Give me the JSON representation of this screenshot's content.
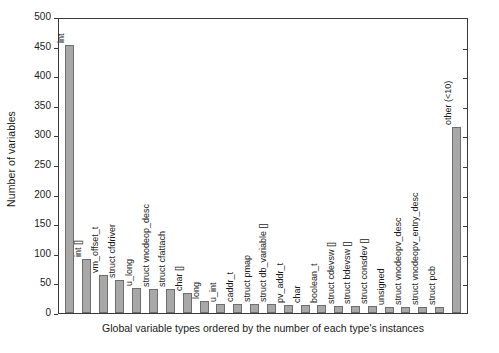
{
  "chart_data": {
    "type": "bar",
    "title": "",
    "xlabel": "Global variable types ordered by the number of each type's instances",
    "ylabel": "Number of variables",
    "ylim": [
      0,
      500
    ],
    "ytick_step": 50,
    "grid": false,
    "legend": "none",
    "bar_color": "#a8a8a8",
    "bar_edge_color": "#6e6e6e",
    "categories": [
      "int",
      "int []",
      "vm_offset_t",
      "struct cfdriver",
      "u_long",
      "struct vnodeop_desc",
      "struct cfattach",
      "char []",
      "long",
      "u_int",
      "caddr_t",
      "struct pmap",
      "struct db_variable []",
      "pv_addr_t",
      "char",
      "boolean_t",
      "struct cdevsw []",
      "struct bdevsw []",
      "struct consdev []",
      "unsigned",
      "struct vnodeopv_desc",
      "struct vnodeopv_entry_desc",
      "struct pcb",
      "other (<10)"
    ],
    "values": [
      453,
      92,
      65,
      55,
      43,
      40,
      40,
      33,
      20,
      16,
      15,
      15,
      15,
      13,
      13,
      13,
      12,
      12,
      12,
      11,
      11,
      11,
      11,
      315
    ],
    "yticks": [
      "0",
      "50",
      "100",
      "150",
      "200",
      "250",
      "300",
      "350",
      "400",
      "450",
      "500"
    ]
  }
}
